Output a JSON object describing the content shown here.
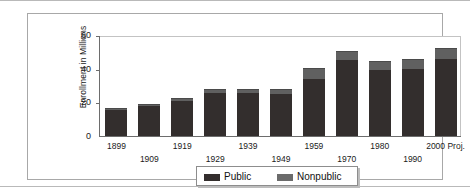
{
  "chart_data": {
    "type": "bar",
    "subtype": "stacked-bar",
    "title": "",
    "xlabel": "",
    "ylabel": "Enrollment in Millions",
    "ylim": [
      0,
      60
    ],
    "yticks": [
      0,
      20,
      40,
      60
    ],
    "ytick_labels": [
      "0",
      "20",
      "40",
      "60"
    ],
    "grid": false,
    "legend_position": "bottom-center",
    "categories": [
      "1899",
      "1909",
      "1919",
      "1929",
      "1939",
      "1949",
      "1959",
      "1970",
      "1980",
      "1990",
      "2000 Proj."
    ],
    "series": [
      {
        "name": "Public",
        "color": "#332e2d",
        "values": [
          15.5,
          17.8,
          21.0,
          25.7,
          25.7,
          25.1,
          34.0,
          45.0,
          39.5,
          39.8,
          46.0
        ]
      },
      {
        "name": "Nonpublic",
        "color": "#606060",
        "values": [
          1.2,
          1.2,
          1.3,
          2.4,
          2.0,
          2.9,
          6.3,
          5.5,
          5.0,
          5.7,
          6.5
        ]
      }
    ],
    "totals": [
      16.7,
      19.0,
      22.3,
      28.1,
      27.7,
      28.0,
      40.3,
      50.5,
      44.5,
      45.5,
      52.5
    ],
    "xlabel_rows": [
      0,
      1,
      0,
      1,
      0,
      1,
      0,
      1,
      0,
      1,
      0
    ]
  },
  "legend": {
    "entries": [
      {
        "label": "Public",
        "swatch": "public-swatch"
      },
      {
        "label": "Nonpublic",
        "swatch": "nonpublic-swatch"
      }
    ]
  },
  "axis": {
    "y_title": "Enrollment in Millions",
    "y_tick_0": "0",
    "y_tick_1": "20",
    "y_tick_2": "40",
    "y_tick_3": "60"
  }
}
